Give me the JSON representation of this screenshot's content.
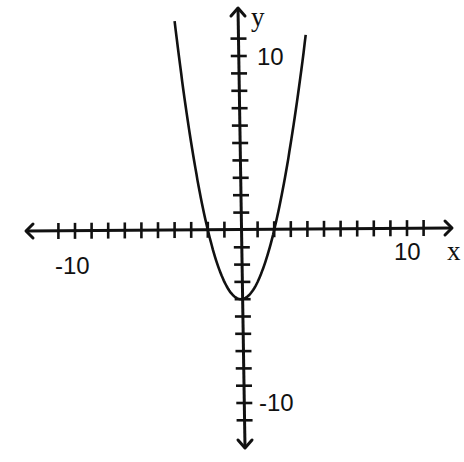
{
  "chart_data": {
    "type": "line",
    "title": "",
    "function": "y = x^2 - 4",
    "xlabel": "x",
    "ylabel": "y",
    "xlim": [
      -12,
      12
    ],
    "ylim": [
      -12,
      12
    ],
    "grid": false,
    "legend": null,
    "x_tick_step": 1,
    "y_tick_step": 1,
    "x_ticks_range": [
      -11,
      11
    ],
    "y_ticks_range": [
      -11,
      11
    ],
    "x_tick_labels": [
      {
        "value": -10,
        "label": "-10"
      },
      {
        "value": 10,
        "label": "10"
      }
    ],
    "y_tick_labels": [
      {
        "value": 10,
        "label": "10"
      },
      {
        "value": -10,
        "label": "-10"
      }
    ],
    "series": [
      {
        "name": "parabola",
        "x": [
          -4.0,
          -3.5,
          -3.0,
          -2.5,
          -2.0,
          -1.5,
          -1.0,
          -0.5,
          0,
          0.5,
          1.0,
          1.5,
          2.0,
          2.5,
          3.0,
          3.5,
          3.9
        ],
        "y": [
          12.0,
          8.25,
          5.0,
          2.25,
          0,
          -1.75,
          -3.0,
          -3.75,
          -4.0,
          -3.75,
          -3.0,
          -1.75,
          0,
          2.25,
          5.0,
          8.25,
          11.21
        ]
      }
    ],
    "annotations": {
      "vertex": [
        0,
        -4
      ],
      "x_intercepts": [
        -2,
        2
      ],
      "y_intercept": -4
    }
  },
  "labels": {
    "x_axis_name": "x",
    "y_axis_name": "y",
    "x_neg10": "-10",
    "x_pos10": "10",
    "y_pos10": "10",
    "y_neg10": "-10"
  },
  "colors": {
    "ink": "#111111",
    "background": "#ffffff"
  }
}
